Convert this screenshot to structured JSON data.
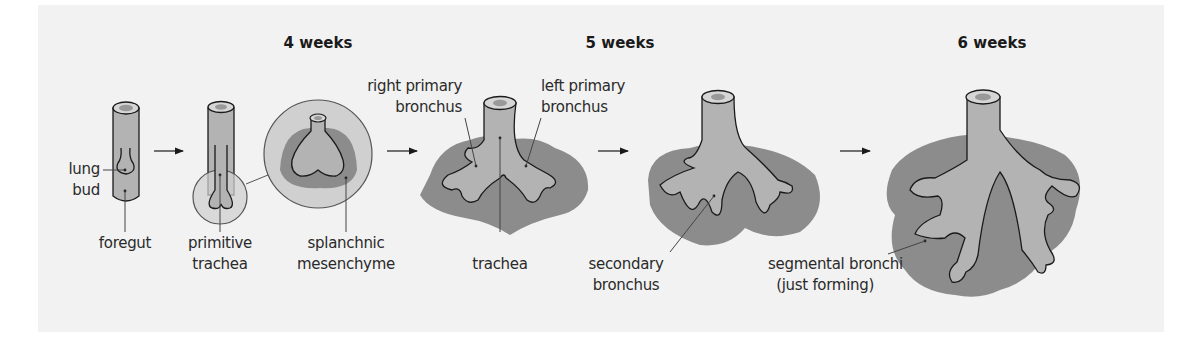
{
  "figure": {
    "colors": {
      "background": "#f2f2f2",
      "tube": "#b3b3b3",
      "tube_top": "#d6d6d6",
      "lumen": "#999999",
      "mesenchyme": "#8c8c8c",
      "circle": "#d0d0d0",
      "outline": "#1a1a1a",
      "leader": "#444444"
    },
    "stages": [
      {
        "id": "4w",
        "heading": "4 weeks"
      },
      {
        "id": "5w",
        "heading": "5 weeks"
      },
      {
        "id": "6w",
        "heading": "6 weeks"
      }
    ],
    "labels": {
      "lung_bud": [
        "lung",
        "bud"
      ],
      "foregut": "foregut",
      "primitive_trachea": [
        "primitive",
        "trachea"
      ],
      "splanchnic_mesenchyme": [
        "splanchnic",
        "mesenchyme"
      ],
      "right_primary_bronchus": [
        "right primary",
        "bronchus"
      ],
      "left_primary_bronchus": [
        "left primary",
        "bronchus"
      ],
      "trachea": "trachea",
      "secondary_bronchus": [
        "secondary",
        "bronchus"
      ],
      "segmental_bronchi": [
        "segmental bronchi",
        "(just forming)"
      ]
    },
    "arrows": [
      "arrow-1",
      "arrow-2",
      "arrow-3",
      "arrow-4"
    ]
  }
}
